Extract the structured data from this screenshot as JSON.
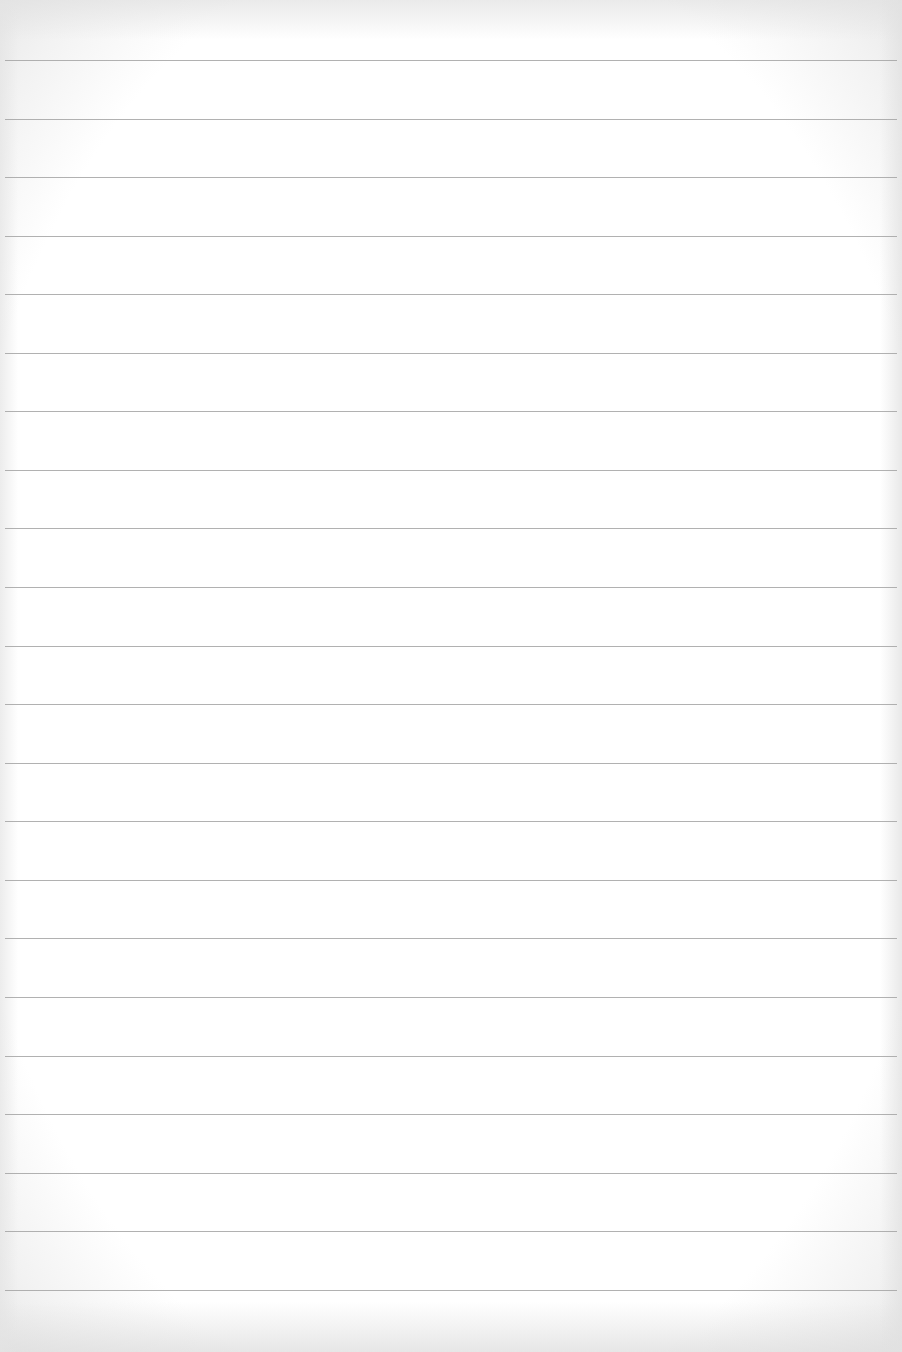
{
  "document": {
    "type": "lined-paper",
    "text": "",
    "colors": {
      "paper": "#ffffff",
      "rule": "#a3a3a3",
      "edge": "#e6e6e6"
    },
    "rules": {
      "count": 22,
      "first_y": 60,
      "spacing": 58.6,
      "positions_y": [
        60,
        119,
        177,
        236,
        294,
        353,
        411,
        470,
        528,
        587,
        646,
        704,
        763,
        821,
        880,
        938,
        997,
        1056,
        1114,
        1173,
        1231,
        1290
      ]
    }
  }
}
